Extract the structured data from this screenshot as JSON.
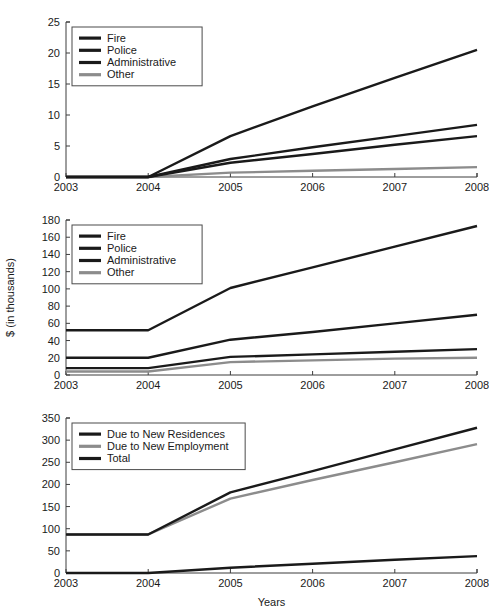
{
  "figure": {
    "background": "#ffffff",
    "panel_count": 3
  },
  "chart_data": [
    {
      "type": "line",
      "title": "",
      "xlabel": "",
      "ylabel": "",
      "x": [
        2003,
        2004,
        2005,
        2006,
        2007,
        2008
      ],
      "xtick_labels": [
        "2003",
        "2004",
        "2005",
        "2006",
        "2007",
        "2008"
      ],
      "ytick_labels": [
        "0",
        "5",
        "10",
        "15",
        "20",
        "25"
      ],
      "yticks": [
        0,
        5,
        10,
        15,
        20,
        25
      ],
      "xlim": [
        2003,
        2008
      ],
      "ylim": [
        0,
        25
      ],
      "grid": false,
      "legend_position": "upper-left",
      "series": [
        {
          "name": "Fire",
          "color": "#1a1a1a",
          "width": 2.4,
          "values": [
            0,
            0,
            6.6,
            11.4,
            16.0,
            20.5
          ]
        },
        {
          "name": "Police",
          "color": "#1a1a1a",
          "width": 2.4,
          "values": [
            0,
            0,
            2.9,
            4.8,
            6.6,
            8.4
          ]
        },
        {
          "name": "Administrative",
          "color": "#1a1a1a",
          "width": 2.4,
          "values": [
            0,
            0,
            2.3,
            3.7,
            5.2,
            6.6
          ]
        },
        {
          "name": "Other",
          "color": "#8c8c8c",
          "width": 2.4,
          "values": [
            0,
            0,
            0.7,
            1.0,
            1.3,
            1.6
          ]
        }
      ]
    },
    {
      "type": "line",
      "title": "",
      "xlabel": "",
      "ylabel": "$ (in thousands)",
      "x": [
        2003,
        2004,
        2005,
        2006,
        2007,
        2008
      ],
      "xtick_labels": [
        "2003",
        "2004",
        "2005",
        "2006",
        "2007",
        "2008"
      ],
      "ytick_labels": [
        "0",
        "20",
        "40",
        "60",
        "80",
        "100",
        "120",
        "140",
        "160",
        "180"
      ],
      "yticks": [
        0,
        20,
        40,
        60,
        80,
        100,
        120,
        140,
        160,
        180
      ],
      "xlim": [
        2003,
        2008
      ],
      "ylim": [
        0,
        180
      ],
      "grid": false,
      "legend_position": "upper-left",
      "series": [
        {
          "name": "Fire",
          "color": "#1a1a1a",
          "width": 2.4,
          "values": [
            52,
            52,
            101,
            125,
            149,
            173
          ]
        },
        {
          "name": "Police",
          "color": "#1a1a1a",
          "width": 2.4,
          "values": [
            20,
            20,
            41,
            50,
            60,
            70
          ]
        },
        {
          "name": "Administrative",
          "color": "#1a1a1a",
          "width": 2.4,
          "values": [
            8,
            8,
            21,
            24,
            27,
            30
          ]
        },
        {
          "name": "Other",
          "color": "#8c8c8c",
          "width": 2.4,
          "values": [
            4,
            4,
            15,
            17,
            19,
            20
          ]
        }
      ]
    },
    {
      "type": "line",
      "title": "",
      "xlabel": "Years",
      "ylabel": "",
      "x": [
        2003,
        2004,
        2005,
        2006,
        2007,
        2008
      ],
      "xtick_labels": [
        "2003",
        "2004",
        "2005",
        "2006",
        "2007",
        "2008"
      ],
      "ytick_labels": [
        "0",
        "50",
        "100",
        "150",
        "200",
        "250",
        "300",
        "350"
      ],
      "yticks": [
        0,
        50,
        100,
        150,
        200,
        250,
        300,
        350
      ],
      "xlim": [
        2003,
        2008
      ],
      "ylim": [
        0,
        350
      ],
      "grid": false,
      "legend_position": "upper-left",
      "series": [
        {
          "name": "Due to New Residences",
          "color": "#1a1a1a",
          "width": 2.4,
          "values": [
            0,
            0,
            12,
            21,
            30,
            38
          ]
        },
        {
          "name": "Due to New Employment",
          "color": "#8c8c8c",
          "width": 2.4,
          "values": [
            87,
            87,
            168,
            210,
            250,
            291
          ]
        },
        {
          "name": "Total",
          "color": "#1a1a1a",
          "width": 2.4,
          "values": [
            87,
            87,
            182,
            230,
            279,
            328
          ]
        }
      ]
    }
  ]
}
